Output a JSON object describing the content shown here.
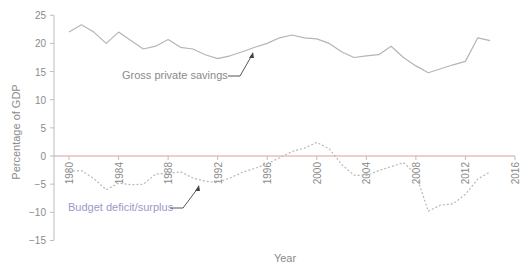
{
  "chart_data": {
    "type": "line",
    "title": "",
    "xlabel": "Year",
    "ylabel": "Percentage of GDP",
    "xlim": [
      1980,
      2016
    ],
    "ylim": [
      -15,
      25
    ],
    "x_ticks": [
      1980,
      1984,
      1988,
      1992,
      1996,
      2000,
      2004,
      2008,
      2012,
      2016
    ],
    "y_ticks": [
      25,
      20,
      15,
      10,
      5,
      0,
      -5,
      -10,
      -15
    ],
    "grid": false,
    "legend": "none (inline annotations)",
    "x": [
      1980,
      1981,
      1982,
      1983,
      1984,
      1985,
      1986,
      1987,
      1988,
      1989,
      1990,
      1991,
      1992,
      1993,
      1994,
      1995,
      1996,
      1997,
      1998,
      1999,
      2000,
      2001,
      2002,
      2003,
      2004,
      2005,
      2006,
      2007,
      2008,
      2009,
      2010,
      2011,
      2012,
      2013,
      2014
    ],
    "series": [
      {
        "name": "Gross private savings",
        "style": "solid",
        "color": "#b5b5b5",
        "values": [
          22.0,
          23.3,
          22.0,
          20.0,
          22.0,
          20.5,
          19.0,
          19.5,
          20.7,
          19.3,
          19.0,
          18.0,
          17.3,
          17.8,
          18.5,
          19.3,
          20.0,
          21.0,
          21.5,
          21.0,
          20.8,
          20.0,
          18.5,
          17.5,
          17.8,
          18.0,
          19.5,
          17.5,
          16.0,
          14.8,
          15.5,
          16.2,
          16.8,
          21.0,
          20.5
        ]
      },
      {
        "name": "Budget deficit/surplus",
        "style": "dashed",
        "color": "#b8b8b8",
        "values": [
          -2.7,
          -2.6,
          -4.0,
          -6.0,
          -4.8,
          -5.1,
          -5.0,
          -3.2,
          -3.1,
          -2.8,
          -3.9,
          -4.5,
          -4.7,
          -3.9,
          -2.9,
          -2.2,
          -1.4,
          -0.3,
          0.8,
          1.4,
          2.4,
          1.3,
          -1.5,
          -3.4,
          -3.5,
          -2.6,
          -1.9,
          -1.2,
          -3.2,
          -9.8,
          -8.7,
          -8.5,
          -6.8,
          -4.1,
          -2.8
        ]
      }
    ],
    "annotations": [
      {
        "text": "Gross private savings",
        "points_to_year": 1996,
        "color": "#8a8a8a"
      },
      {
        "text": "Budget deficit/surplus",
        "points_to_year": 1991,
        "color": "#9a9ac8"
      }
    ]
  },
  "colors": {
    "axis": "#bdbdbd",
    "zero_line": "#d9a0a0",
    "tick_text": "#8a8a8a",
    "annotation_budget": "#9a9ac8"
  }
}
